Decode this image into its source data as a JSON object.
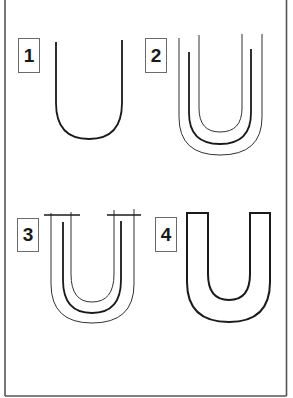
{
  "diagram": {
    "title": "",
    "colors": {
      "stroke": "#1a1a1a",
      "frame": "#555555",
      "background": "#ffffff"
    },
    "steps": [
      {
        "number": "1",
        "description": "Single U-shaped skeleton line"
      },
      {
        "number": "2",
        "description": "Outline lines added on both sides of the skeleton"
      },
      {
        "number": "3",
        "description": "Horizontal serif lines added across the tops"
      },
      {
        "number": "4",
        "description": "Final solid block letter U outline"
      }
    ]
  }
}
